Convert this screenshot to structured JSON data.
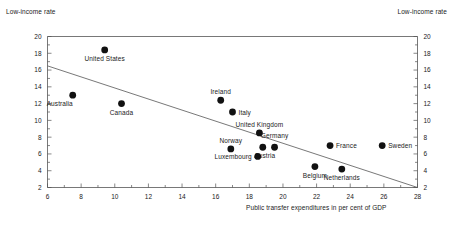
{
  "chart_data": {
    "type": "scatter",
    "title": "",
    "xlabel": "Public transfer expenditures in per cent of GDP",
    "ylabel": "Low-income rate",
    "ylabel_right": "Low-income rate",
    "xlim": [
      6,
      28
    ],
    "ylim": [
      2,
      20
    ],
    "xticks": [
      6,
      8,
      10,
      12,
      14,
      16,
      18,
      20,
      22,
      24,
      26,
      28
    ],
    "yticks": [
      2,
      4,
      6,
      8,
      10,
      12,
      14,
      16,
      18,
      20
    ],
    "xtick_minor_step": 1,
    "ytick_minor_step": 1,
    "grid": false,
    "legend": "none",
    "marker": "filled-circle",
    "marker_color": "#111111",
    "trendline": {
      "label": "regression-line",
      "x": [
        6,
        28
      ],
      "y": [
        16.5,
        2.0
      ],
      "color": "#555555"
    },
    "points": [
      {
        "name": "Australia",
        "x": 7.5,
        "y": 13.0,
        "label_dx": -13,
        "label_dy": 11,
        "anchor": "middle"
      },
      {
        "name": "United States",
        "x": 9.4,
        "y": 18.4,
        "label_dx": 0,
        "label_dy": 11,
        "anchor": "middle"
      },
      {
        "name": "Canada",
        "x": 10.4,
        "y": 12.0,
        "label_dx": 0,
        "label_dy": 11,
        "anchor": "middle"
      },
      {
        "name": "Ireland",
        "x": 16.3,
        "y": 12.4,
        "label_dx": 0,
        "label_dy": -6,
        "anchor": "middle"
      },
      {
        "name": "Italy",
        "x": 17.0,
        "y": 11.0,
        "label_dx": 6,
        "label_dy": 2.5,
        "anchor": "start"
      },
      {
        "name": "Norway",
        "x": 16.9,
        "y": 6.6,
        "label_dx": 0,
        "label_dy": -6,
        "anchor": "middle"
      },
      {
        "name": "United Kingdom",
        "x": 18.6,
        "y": 8.5,
        "label_dx": 0,
        "label_dy": -6,
        "anchor": "middle"
      },
      {
        "name": "Austria",
        "x": 18.8,
        "y": 6.8,
        "label_dx": 2,
        "label_dy": 11,
        "anchor": "middle"
      },
      {
        "name": "Luxembourg",
        "x": 18.5,
        "y": 5.7,
        "label_dx": -6,
        "label_dy": 2.5,
        "anchor": "end"
      },
      {
        "name": "Germany",
        "x": 19.5,
        "y": 6.8,
        "label_dx": 0,
        "label_dy": -9,
        "anchor": "middle"
      },
      {
        "name": "Belgium",
        "x": 21.9,
        "y": 4.5,
        "label_dx": 0,
        "label_dy": 11,
        "anchor": "middle"
      },
      {
        "name": "France",
        "x": 22.8,
        "y": 7.0,
        "label_dx": 6,
        "label_dy": 2.5,
        "anchor": "start"
      },
      {
        "name": "Netherlands",
        "x": 23.5,
        "y": 4.2,
        "label_dx": 0,
        "label_dy": 11,
        "anchor": "middle"
      },
      {
        "name": "Sweden",
        "x": 25.9,
        "y": 7.0,
        "label_dx": 6,
        "label_dy": 2.5,
        "anchor": "start"
      }
    ]
  }
}
